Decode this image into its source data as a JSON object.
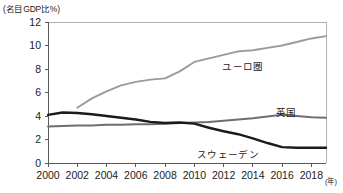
{
  "axis": {
    "unit_label": "(名目GDP比%)",
    "x_unit_suffix": "(年)",
    "y_ticks": [
      "0",
      "2",
      "4",
      "6",
      "8",
      "10",
      "12"
    ],
    "x_ticks": [
      "2000",
      "2002",
      "2004",
      "2006",
      "2008",
      "2010",
      "2012",
      "2014",
      "2016",
      "2018"
    ]
  },
  "labels": {
    "eurozone": "ユーロ圏",
    "uk": "英国",
    "sweden": "スウェーデン"
  },
  "colors": {
    "eurozone_line": "#9a9a9a",
    "uk_line": "#6e6e6e",
    "sweden_line": "#1b1b1b",
    "frame": "#b4b4b4",
    "text": "#1b1b1b"
  },
  "chart_data": {
    "type": "line",
    "title": "",
    "subtitle": "",
    "xlabel": "(年)",
    "ylabel": "(名目GDP比%)",
    "xlim": [
      2000,
      2019
    ],
    "ylim": [
      0,
      12
    ],
    "grid": false,
    "legend": "inline-annotations",
    "x": [
      2000,
      2001,
      2002,
      2003,
      2004,
      2005,
      2006,
      2007,
      2008,
      2009,
      2010,
      2011,
      2012,
      2013,
      2014,
      2015,
      2016,
      2017,
      2018,
      2019
    ],
    "series": [
      {
        "name": "ユーロ圏",
        "color": "#9a9a9a",
        "values": [
          null,
          null,
          4.7,
          5.5,
          6.1,
          6.6,
          6.9,
          7.1,
          7.2,
          7.8,
          8.6,
          8.9,
          9.2,
          9.5,
          9.6,
          9.8,
          10.0,
          10.3,
          10.6,
          10.8
        ]
      },
      {
        "name": "英国",
        "color": "#6e6e6e",
        "values": [
          3.1,
          3.15,
          3.2,
          3.2,
          3.25,
          3.25,
          3.3,
          3.3,
          3.35,
          3.4,
          3.45,
          3.5,
          3.6,
          3.7,
          3.8,
          3.95,
          4.1,
          4.0,
          3.9,
          3.85
        ]
      },
      {
        "name": "スウェーデン",
        "color": "#1b1b1b",
        "values": [
          4.1,
          4.3,
          4.25,
          4.15,
          4.0,
          3.85,
          3.7,
          3.5,
          3.4,
          3.45,
          3.35,
          3.0,
          2.7,
          2.45,
          2.1,
          1.7,
          1.35,
          1.3,
          1.3,
          1.3
        ]
      }
    ]
  }
}
